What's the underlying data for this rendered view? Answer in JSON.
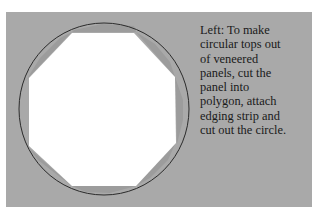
{
  "caption": {
    "lines": [
      "Left: To make",
      "circular tops out",
      "of veneered",
      "panels, cut the",
      "panel into",
      "polygon, attach",
      "edging strip and",
      "cut out the circle."
    ]
  },
  "illustration": {
    "description": "octagonal-panel-inside-circle",
    "colors": {
      "background": "#a9a9a9",
      "panel": "#ffffff",
      "edging": "#9b9b9b",
      "circle_stroke": "#2b2b2b"
    }
  }
}
